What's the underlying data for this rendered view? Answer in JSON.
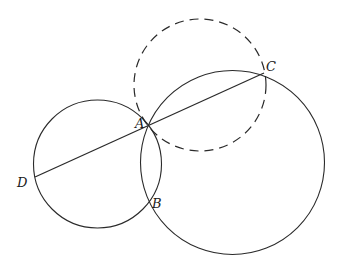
{
  "figure": {
    "width": 339,
    "height": 279,
    "circles": [
      {
        "name": "small-circle",
        "cx": 97.5,
        "cy": 164,
        "r": 64,
        "style": "solid"
      },
      {
        "name": "large-circle",
        "cx": 232.5,
        "cy": 162.5,
        "r": 92,
        "style": "solid"
      },
      {
        "name": "dashed-circle",
        "cx": 200,
        "cy": 85,
        "r": 66,
        "style": "dashed"
      }
    ],
    "segments": [
      {
        "name": "segment-DC",
        "from": "D",
        "to": "C"
      }
    ],
    "points": [
      {
        "id": "A",
        "label": "A",
        "x": 149,
        "y": 125,
        "lx": 135,
        "ly": 128
      },
      {
        "id": "B",
        "label": "B",
        "x": 148,
        "y": 203,
        "lx": 152,
        "ly": 208
      },
      {
        "id": "C",
        "label": "C",
        "x": 264,
        "y": 73,
        "lx": 266,
        "ly": 71
      },
      {
        "id": "D",
        "label": "D",
        "x": 35,
        "y": 177,
        "lx": 17,
        "ly": 187
      }
    ]
  },
  "labels": {
    "A": "A",
    "B": "B",
    "C": "C",
    "D": "D"
  }
}
